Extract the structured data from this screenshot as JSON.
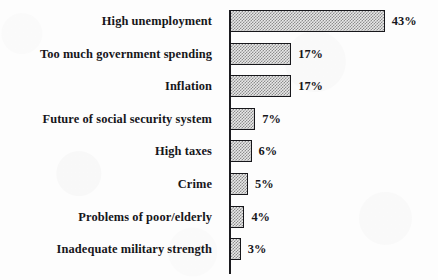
{
  "chart_data": {
    "type": "bar",
    "orientation": "horizontal",
    "title": "",
    "subtitle": "",
    "xlabel": "",
    "ylabel": "",
    "grid": false,
    "legend": null,
    "axis": {
      "baseline_at": 0,
      "xlim": [
        0,
        43
      ],
      "value_suffix": "%"
    },
    "categories": [
      "High unemployment",
      "Too much government spending",
      "Inflation",
      "Future of social security system",
      "High taxes",
      "Crime",
      "Problems of poor/elderly",
      "Inadequate military strength"
    ],
    "values": [
      43,
      17,
      17,
      7,
      6,
      5,
      4,
      3
    ],
    "value_labels": [
      "43%",
      "17%",
      "17%",
      "7%",
      "6%",
      "5%",
      "4%",
      "3%"
    ],
    "colors": {
      "bar_fill": "#e8e8e8",
      "bar_hatch": "#8d8d8d",
      "bar_outline": "#17171b",
      "axis": "#1b1b1f",
      "text": "#16161a",
      "background": "#fdfdfd"
    }
  }
}
